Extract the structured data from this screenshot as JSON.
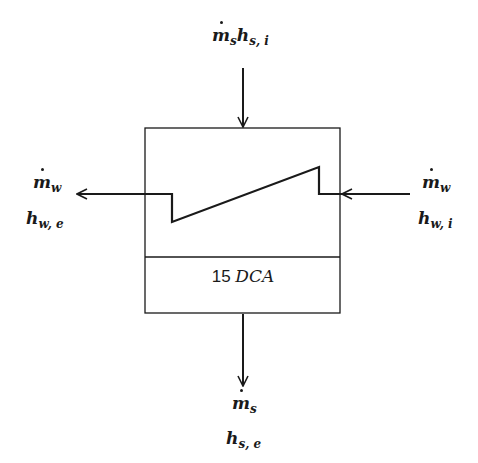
{
  "diagram": {
    "type": "heater-control-volume",
    "colors": {
      "line": "#1a1a1a",
      "background": "#ffffff"
    },
    "box_label": {
      "number": "15",
      "text": "DCA"
    },
    "streams": {
      "steam_in": {
        "symbol": "m",
        "sub": "s",
        "enthalpy": "h",
        "enthalpy_sub": "s, i"
      },
      "water_out": {
        "symbol": "m",
        "sub": "w",
        "enthalpy": "h",
        "enthalpy_sub": "w, e"
      },
      "water_in": {
        "symbol": "m",
        "sub": "w",
        "enthalpy": "h",
        "enthalpy_sub": "w, i"
      },
      "steam_out": {
        "symbol": "m",
        "sub": "s",
        "enthalpy": "h",
        "enthalpy_sub": "s, e"
      }
    }
  }
}
